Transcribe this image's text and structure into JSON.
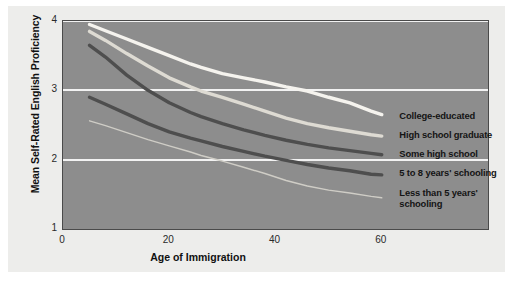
{
  "chart_data": {
    "type": "line",
    "title": "",
    "xlabel": "Age of Immigration",
    "ylabel": "Mean Self-Rated English Proficiency",
    "xlim": [
      0,
      80
    ],
    "ylim": [
      1,
      4
    ],
    "xticks": [
      "0",
      "20",
      "40",
      "60"
    ],
    "xtick_values": [
      0,
      20,
      40,
      60
    ],
    "yticks": [
      "1",
      "2",
      "3",
      "4"
    ],
    "ytick_values": [
      1,
      2,
      3,
      4
    ],
    "grid": "horizontal gridlines at y = 2, 3, 4",
    "legend_position": "inline labels at right end of each line",
    "plot_background": "#8d8d8d",
    "page_background": "#ededeb",
    "series": [
      {
        "name": "College-educated",
        "color": "#f5f3ee",
        "width": 3.4,
        "x": [
          5,
          8,
          12,
          16,
          20,
          24,
          26,
          30,
          34,
          38,
          42,
          46,
          50,
          54,
          58,
          60
        ],
        "values": [
          3.95,
          3.86,
          3.74,
          3.62,
          3.5,
          3.38,
          3.33,
          3.24,
          3.18,
          3.12,
          3.05,
          2.99,
          2.9,
          2.82,
          2.7,
          2.65
        ]
      },
      {
        "name": "High school graduate",
        "color": "#dedbd3",
        "width": 3.4,
        "x": [
          5,
          8,
          12,
          16,
          20,
          24,
          26,
          30,
          34,
          38,
          42,
          46,
          50,
          54,
          58,
          60
        ],
        "values": [
          3.85,
          3.72,
          3.53,
          3.35,
          3.18,
          3.05,
          2.99,
          2.9,
          2.8,
          2.7,
          2.6,
          2.52,
          2.46,
          2.41,
          2.36,
          2.34
        ]
      },
      {
        "name": "Some high school",
        "color": "#4e4e4e",
        "width": 3.4,
        "x": [
          5,
          8,
          12,
          16,
          20,
          24,
          26,
          30,
          34,
          38,
          42,
          46,
          50,
          54,
          58,
          60
        ],
        "values": [
          3.65,
          3.48,
          3.22,
          3.0,
          2.82,
          2.68,
          2.62,
          2.52,
          2.43,
          2.35,
          2.28,
          2.22,
          2.17,
          2.13,
          2.09,
          2.07
        ]
      },
      {
        "name": "5 to 8 years' schooling",
        "color": "#4e4e4e",
        "width": 3.4,
        "x": [
          5,
          8,
          12,
          16,
          20,
          24,
          26,
          30,
          34,
          38,
          42,
          46,
          50,
          54,
          58,
          60
        ],
        "values": [
          2.9,
          2.8,
          2.66,
          2.52,
          2.4,
          2.31,
          2.27,
          2.19,
          2.12,
          2.05,
          1.99,
          1.93,
          1.88,
          1.84,
          1.79,
          1.78
        ]
      },
      {
        "name": "Less than 5 years' schooling",
        "color": "#cfcdc6",
        "width": 1.4,
        "x": [
          5,
          8,
          12,
          16,
          20,
          24,
          26,
          30,
          34,
          38,
          42,
          46,
          50,
          54,
          58,
          60
        ],
        "values": [
          2.56,
          2.49,
          2.39,
          2.29,
          2.2,
          2.11,
          2.06,
          1.98,
          1.89,
          1.8,
          1.7,
          1.62,
          1.56,
          1.52,
          1.47,
          1.45
        ]
      }
    ],
    "series_labels": [
      {
        "text": "College-educated",
        "y_value": 2.62
      },
      {
        "text": "High school graduate",
        "y_value": 2.34
      },
      {
        "text": "Some high school",
        "y_value": 2.07
      },
      {
        "text": "5 to 8 years' schooling",
        "y_value": 1.8
      },
      {
        "text": "Less than 5 years'\nschooling",
        "y_value": 1.5
      }
    ]
  }
}
